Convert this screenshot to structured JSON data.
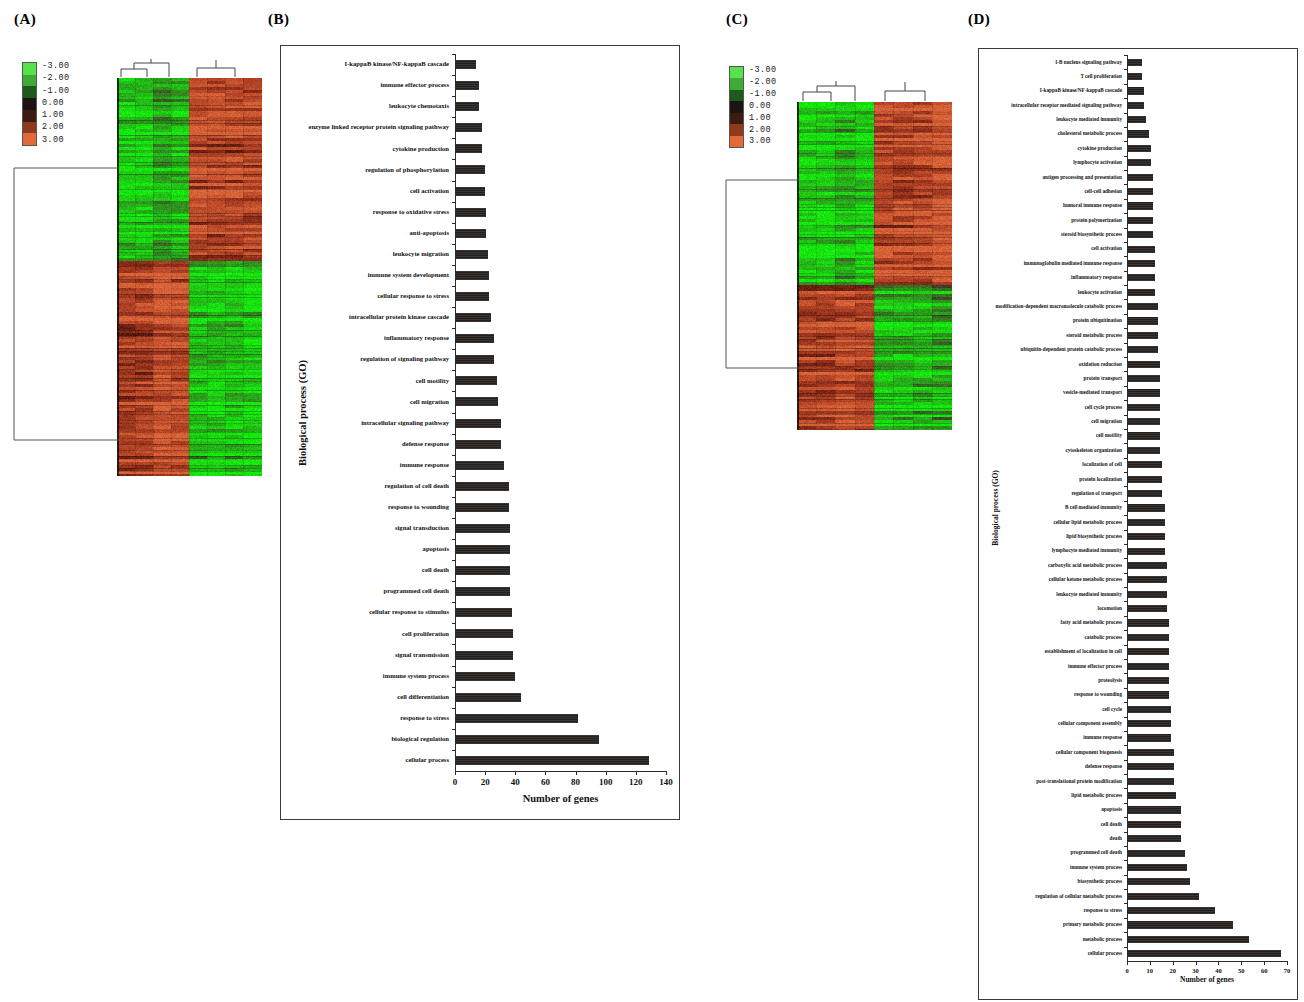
{
  "figure": {
    "panels": [
      {
        "id": "A",
        "letter": "(A)"
      },
      {
        "id": "B",
        "letter": "(B)"
      },
      {
        "id": "C",
        "letter": "(C)"
      },
      {
        "id": "D",
        "letter": "(D)"
      }
    ]
  },
  "heatmap_legend": {
    "labels": [
      "-3.00",
      "-2.00",
      "-1.00",
      "0.00",
      "1.00",
      "2.00",
      "3.00"
    ],
    "colors": [
      "#55e24a",
      "#3faa35",
      "#1d5a1e",
      "#1b1410",
      "#3a1c10",
      "#8f3a1c",
      "#e2693a"
    ],
    "low_color": "#55e24a",
    "mid_color": "#1b1410",
    "high_color": "#e2693a"
  },
  "chart_data": [
    {
      "panel": "B",
      "type": "bar",
      "orientation": "horizontal",
      "title": "",
      "xlabel": "Number of genes",
      "ylabel": "Biological process (GO)",
      "xlim": [
        0,
        140
      ],
      "xticks": [
        0,
        20,
        40,
        60,
        80,
        100,
        120,
        140
      ],
      "grid": false,
      "legend": "none",
      "categories": [
        "I-kappaB kinase/NF-kappaB cascade",
        "immune effector process",
        "leukocyte chemotaxis",
        "enzyme linked receptor protein signaling pathway",
        "cytokine production",
        "regulation of phosphorylation",
        "cell activation",
        "response to oxidative stress",
        "anti-apoptosis",
        "leukocyte migration",
        "immune system development",
        "cellular response to stress",
        "intracellular protein kinase cascade",
        "inflammatory response",
        "regulation of signaling pathway",
        "cell motility",
        "cell migration",
        "intracellular signaling pathway",
        "defense response",
        "immune response",
        "regulation of cell death",
        "response to wounding",
        "signal transduction",
        "apoptosis",
        "cell death",
        "programmed cell death",
        "cellular response to stimulus",
        "cell proliferation",
        "signal transmission",
        "immune system process",
        "cell differentiation",
        "response to stress",
        "biological regulation",
        "cellular process"
      ],
      "values": [
        13,
        15,
        15,
        17,
        17,
        19,
        19,
        20,
        20,
        21,
        22,
        22,
        23,
        25,
        25,
        27,
        28,
        30,
        30,
        32,
        35,
        35,
        36,
        36,
        36,
        36,
        37,
        38,
        38,
        39,
        43,
        81,
        95,
        128
      ]
    },
    {
      "panel": "D",
      "type": "bar",
      "orientation": "horizontal",
      "title": "",
      "xlabel": "Number of genes",
      "ylabel": "Biological process (GO)",
      "xlim": [
        0,
        70
      ],
      "xticks": [
        0,
        10,
        20,
        30,
        40,
        50,
        60,
        70
      ],
      "grid": false,
      "legend": "none",
      "categories": [
        "I-B nucleus signaling pathway",
        "T cell proliferation",
        "I-kappaB kinase/NF-kappaB cascade",
        "intracellular receptor mediated signaling pathway",
        "leukocyte mediated immunity",
        "cholesterol metabolic process",
        "cytokine production",
        "lymphocyte activation",
        "antigen processing and presentation",
        "cell-cell adhesion",
        "humoral immune response",
        "protein polymerization",
        "steroid biosynthetic process",
        "cell activation",
        "immunoglobulin mediated immune response",
        "inflammatory response",
        "leukocyte activation",
        "modification-dependent macromolecule catabolic process",
        "protein ubiquitination",
        "steroid metabolic process",
        "ubiquitin-dependent protein catabolic process",
        "oxidation reduction",
        "protein transport",
        "vesicle-mediated transport",
        "cell cycle process",
        "cell migration",
        "cell motility",
        "cytoskeleton organization",
        "localization of cell",
        "protein localization",
        "regulation of transport",
        "B cell mediated immunity",
        "cellular lipid metabolic process",
        "lipid biosynthetic process",
        "lymphocyte mediated immunity",
        "carboxylic acid metabolic process",
        "cellular ketone metabolic process",
        "leukocyte mediated immunity",
        "locomotion",
        "fatty acid metabolic process",
        "catabolic process",
        "establishment of localization in cell",
        "immune effector process",
        "proteolysis",
        "response to wounding",
        "cell cycle",
        "cellular component assembly",
        "immune response",
        "cellular component biogenesis",
        "defense response",
        "post-translational protein modification",
        "lipid metabolic process",
        "apoptosis",
        "cell death",
        "death",
        "programmed cell death",
        "immune system process",
        "biosynthetic process",
        "regulation of cellular metabolic process",
        "response to stress",
        "primary metabolic process",
        "metabolic process",
        "cellular process"
      ],
      "values": [
        6,
        6,
        7,
        7,
        8,
        9,
        10,
        10,
        11,
        11,
        11,
        11,
        11,
        12,
        12,
        12,
        12,
        13,
        13,
        13,
        13,
        14,
        14,
        14,
        14,
        14,
        14,
        14,
        15,
        15,
        15,
        16,
        16,
        16,
        16,
        17,
        17,
        17,
        17,
        18,
        18,
        18,
        18,
        18,
        18,
        19,
        19,
        19,
        20,
        20,
        20,
        21,
        23,
        23,
        23,
        25,
        26,
        27,
        31,
        38,
        46,
        53,
        67
      ]
    }
  ]
}
